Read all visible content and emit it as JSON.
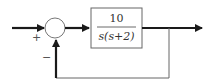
{
  "diagram": {
    "type": "block-diagram",
    "summing_junction": {
      "input_sign": "+",
      "feedback_sign": "−"
    },
    "plant": {
      "numerator": "10",
      "denominator": "s(s+2)"
    },
    "colors": {
      "signal_line": "#1a1a1a",
      "feedback_line": "#666666",
      "block_border": "#666666",
      "circle_border": "#777777"
    }
  }
}
